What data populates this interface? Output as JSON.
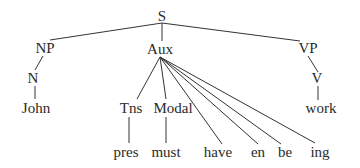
{
  "diagram": {
    "type": "syntax-tree",
    "colors": {
      "line": "#333333",
      "text": "#2a2a2a",
      "background": "#ffffff"
    },
    "nodes": [
      {
        "id": "S",
        "label": "S",
        "x": 162,
        "y": 16
      },
      {
        "id": "NP",
        "label": "NP",
        "x": 45,
        "y": 48
      },
      {
        "id": "Aux",
        "label": "Aux",
        "x": 160,
        "y": 49
      },
      {
        "id": "VP",
        "label": "VP",
        "x": 308,
        "y": 48
      },
      {
        "id": "N",
        "label": "N",
        "x": 33,
        "y": 78
      },
      {
        "id": "V",
        "label": "V",
        "x": 317,
        "y": 78
      },
      {
        "id": "John",
        "label": "John",
        "x": 36,
        "y": 108
      },
      {
        "id": "Tns",
        "label": "Tns",
        "x": 131,
        "y": 108
      },
      {
        "id": "Modal",
        "label": "Modal",
        "x": 173,
        "y": 108
      },
      {
        "id": "work",
        "label": "work",
        "x": 321,
        "y": 108
      },
      {
        "id": "pres",
        "label": "pres",
        "x": 126,
        "y": 152
      },
      {
        "id": "must",
        "label": "must",
        "x": 166,
        "y": 152
      },
      {
        "id": "have",
        "label": "have",
        "x": 218,
        "y": 152
      },
      {
        "id": "en",
        "label": "en",
        "x": 258,
        "y": 152
      },
      {
        "id": "be",
        "label": "be",
        "x": 285,
        "y": 152
      },
      {
        "id": "ing",
        "label": "ing",
        "x": 320,
        "y": 152
      }
    ],
    "edges": [
      {
        "from": "S",
        "to": "NP",
        "x1": 162,
        "y1": 23,
        "x2": 50,
        "y2": 40
      },
      {
        "from": "S",
        "to": "Aux",
        "x1": 162,
        "y1": 23,
        "x2": 162,
        "y2": 41
      },
      {
        "from": "S",
        "to": "VP",
        "x1": 162,
        "y1": 23,
        "x2": 300,
        "y2": 41
      },
      {
        "from": "NP",
        "to": "N",
        "x1": 43,
        "y1": 56,
        "x2": 35,
        "y2": 70
      },
      {
        "from": "N",
        "to": "John",
        "x1": 35,
        "y1": 86,
        "x2": 35,
        "y2": 99
      },
      {
        "from": "VP",
        "to": "V",
        "x1": 308,
        "y1": 56,
        "x2": 318,
        "y2": 72
      },
      {
        "from": "V",
        "to": "work",
        "x1": 318,
        "y1": 86,
        "x2": 318,
        "y2": 100
      },
      {
        "from": "Aux",
        "to": "Tns",
        "x1": 160,
        "y1": 57,
        "x2": 137,
        "y2": 99
      },
      {
        "from": "Aux",
        "to": "Modal",
        "x1": 160,
        "y1": 57,
        "x2": 166,
        "y2": 99
      },
      {
        "from": "Aux",
        "to": "have",
        "x1": 160,
        "y1": 57,
        "x2": 222,
        "y2": 144
      },
      {
        "from": "Aux",
        "to": "en",
        "x1": 160,
        "y1": 57,
        "x2": 258,
        "y2": 144
      },
      {
        "from": "Aux",
        "to": "be",
        "x1": 160,
        "y1": 57,
        "x2": 281,
        "y2": 144
      },
      {
        "from": "Aux",
        "to": "ing",
        "x1": 160,
        "y1": 57,
        "x2": 315,
        "y2": 143
      },
      {
        "from": "Tns",
        "to": "pres",
        "x1": 129,
        "y1": 117,
        "x2": 129,
        "y2": 143
      },
      {
        "from": "Modal",
        "to": "must",
        "x1": 166,
        "y1": 117,
        "x2": 166,
        "y2": 143
      }
    ]
  }
}
